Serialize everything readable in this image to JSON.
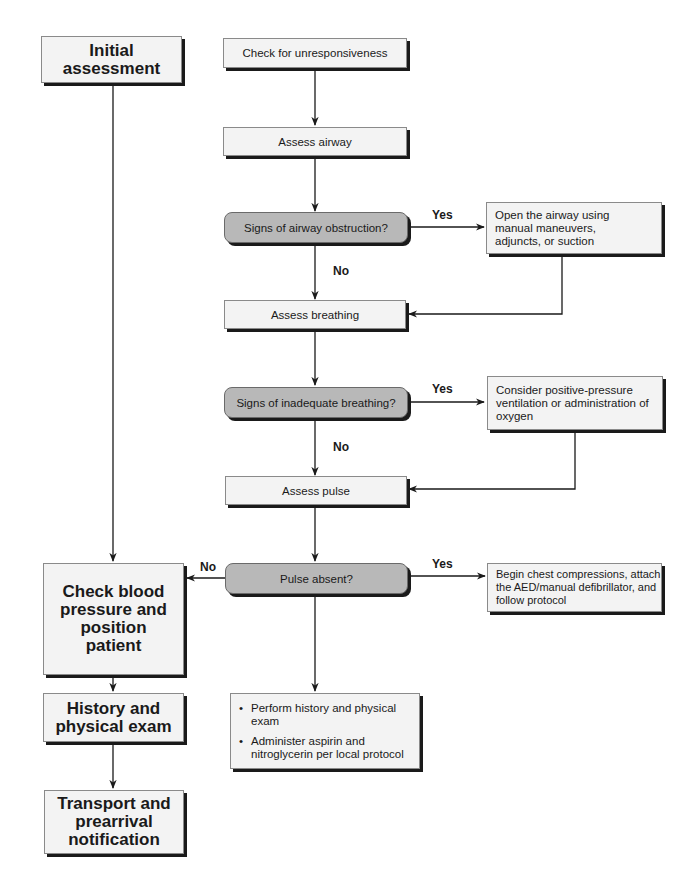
{
  "diagram": {
    "left_column": {
      "initial_assessment": "Initial assessment",
      "check_bp": "Check blood pressure and position patient",
      "history_exam": "History and physical exam",
      "transport": "Transport and prearrival notification"
    },
    "center_column": {
      "check_unresponsiveness": "Check for unresponsiveness",
      "assess_airway": "Assess airway",
      "airway_obstruction_question": "Signs of airway obstruction?",
      "assess_breathing": "Assess breathing",
      "inadequate_breathing_question": "Signs of inadequate breathing?",
      "assess_pulse": "Assess pulse",
      "pulse_absent_question": "Pulse absent?",
      "final_actions": [
        "Perform history and physical exam",
        "Administer aspirin and nitroglycerin per local protocol"
      ]
    },
    "right_column": {
      "open_airway": "Open the airway using manual maneuvers, adjuncts, or suction",
      "consider_ppv": "Consider positive-pressure ventilation or administration of oxygen",
      "chest_compressions": "Begin chest compressions, attach the AED/manual defibrillator, and follow protocol"
    },
    "labels": {
      "yes": "Yes",
      "no": "No",
      "bullet": "•"
    },
    "colors": {
      "box_fill": "#f3f3f3",
      "decision_fill": "#b8b8b8",
      "shadow": "#1a1a1a",
      "line": "#1a1a1a"
    }
  }
}
